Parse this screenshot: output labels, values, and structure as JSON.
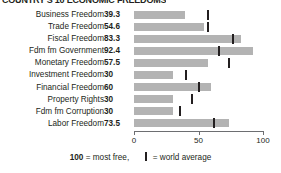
{
  "chart_data": {
    "type": "bar",
    "orientation": "horizontal",
    "title": "COUNTRY'S 10 ECONOMIC FREEDOMS",
    "xlabel": "",
    "ylabel": "",
    "xlim": [
      0,
      100
    ],
    "grid": false,
    "axis_ticks": [
      {
        "value": 0,
        "label": "0"
      },
      {
        "value": 50,
        "label": "50"
      },
      {
        "value": 100,
        "label": "100"
      }
    ],
    "categories": [
      "Business Freedom",
      "Trade Freedom",
      "Fiscal Freedom",
      "Fdm fm Government",
      "Monetary Freedom",
      "Investment Freedom",
      "Financial Freedom",
      "Property Rights",
      "Fdm fm Corruption",
      "Labor Freedom"
    ],
    "values": [
      39.3,
      54.6,
      83.3,
      92.4,
      57.5,
      30,
      60,
      30,
      30,
      73.5
    ],
    "value_labels": [
      "39.3",
      "54.6",
      "83.3",
      "92.4",
      "57.5",
      "30",
      "60",
      "30",
      "30",
      "73.5"
    ],
    "series": [
      {
        "name": "Country score",
        "values": [
          39.3,
          54.6,
          83.3,
          92.4,
          57.5,
          30,
          60,
          30,
          30,
          73.5
        ]
      },
      {
        "name": "world average",
        "marker": "vertical-tick",
        "values": [
          57,
          57,
          77,
          66,
          74,
          40,
          50,
          45,
          36,
          62
        ]
      }
    ],
    "bar_color": "#b3b3b3",
    "marker_color": "#231f20",
    "legend_position": "bottom",
    "legend": {
      "most_free_value": "100",
      "most_free_text": "= most free,",
      "world_average_text": "= world average"
    }
  }
}
